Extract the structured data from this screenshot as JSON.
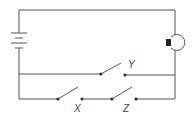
{
  "diagram": {
    "type": "circuit",
    "components": {
      "battery": {
        "name": "battery"
      },
      "bulb": {
        "name": "light bulb"
      },
      "switches": [
        {
          "label": "Y",
          "state": "open",
          "branch": "middle"
        },
        {
          "label": "X",
          "state": "open",
          "branch": "bottom"
        },
        {
          "label": "Z",
          "state": "open",
          "branch": "bottom"
        }
      ]
    },
    "colors": {
      "wire": "#555555",
      "bulb_base": "#222222",
      "background": "#ffffff"
    }
  }
}
